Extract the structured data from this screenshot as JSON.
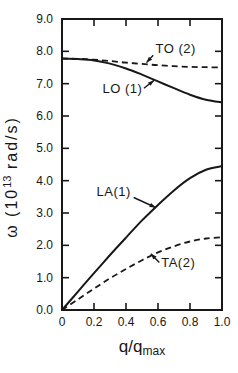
{
  "colors": {
    "ink": "#181818",
    "background": "#ffffff"
  },
  "chart_data": {
    "type": "line",
    "title": "",
    "xlabel": "q/q_max",
    "xlabel_main": "q/q",
    "xlabel_sub": "max",
    "ylabel": "ω (10^13 rad/s)",
    "ylabel_prefix": "ω (10",
    "ylabel_exponent": "13",
    "ylabel_suffix": " rad/s)",
    "xlim": [
      0,
      1.0
    ],
    "ylim": [
      0,
      9.0
    ],
    "grid": false,
    "legend": "inline-annotations",
    "xticks": {
      "values": [
        0,
        0.2,
        0.4,
        0.6,
        0.8,
        1.0
      ],
      "labels": [
        "0",
        "0.2",
        "0.4",
        "0.6",
        "0.8",
        "1.0"
      ]
    },
    "yticks": {
      "values": [
        0,
        1,
        2,
        3,
        4,
        5,
        6,
        7,
        8,
        9
      ],
      "labels": [
        "0.0",
        "1.0",
        "2.0",
        "3.0",
        "4.0",
        "5.0",
        "6.0",
        "7.0",
        "8.0",
        "9.0"
      ]
    },
    "x": [
      0,
      0.1,
      0.2,
      0.3,
      0.4,
      0.5,
      0.6,
      0.7,
      0.8,
      0.9,
      1.0
    ],
    "series": [
      {
        "name": "TO2",
        "label": "TO (2)",
        "style": "dashed",
        "values": [
          7.78,
          7.77,
          7.74,
          7.7,
          7.65,
          7.61,
          7.57,
          7.54,
          7.52,
          7.51,
          7.5
        ],
        "annotation": {
          "anchor": "start",
          "label_x": 0.585,
          "label_y": 7.95,
          "attach_x": 0.57,
          "attach_y": 7.88,
          "tip_x": 0.528,
          "tip_y": 7.65
        }
      },
      {
        "name": "LO1",
        "label": "LO (1)",
        "style": "solid",
        "values": [
          7.78,
          7.76,
          7.72,
          7.62,
          7.47,
          7.28,
          7.07,
          6.86,
          6.66,
          6.5,
          6.42
        ],
        "annotation": {
          "anchor": "end",
          "label_x": 0.502,
          "label_y": 6.7,
          "attach_x": 0.512,
          "attach_y": 6.86,
          "tip_x": 0.575,
          "tip_y": 7.1
        }
      },
      {
        "name": "LA1",
        "label": "LA(1)",
        "style": "solid",
        "values": [
          0,
          0.57,
          1.14,
          1.7,
          2.24,
          2.77,
          3.25,
          3.7,
          4.08,
          4.34,
          4.45
        ],
        "annotation": {
          "anchor": "end",
          "label_x": 0.43,
          "label_y": 3.53,
          "attach_x": 0.448,
          "attach_y": 3.48,
          "tip_x": 0.585,
          "tip_y": 3.17
        }
      },
      {
        "name": "TA2",
        "label": "TA(2)",
        "style": "dashed",
        "values": [
          0,
          0.33,
          0.66,
          0.98,
          1.27,
          1.54,
          1.78,
          1.97,
          2.12,
          2.21,
          2.25
        ],
        "annotation": {
          "anchor": "start",
          "label_x": 0.62,
          "label_y": 1.32,
          "attach_x": 0.608,
          "attach_y": 1.47,
          "tip_x": 0.555,
          "tip_y": 1.74
        }
      }
    ]
  }
}
